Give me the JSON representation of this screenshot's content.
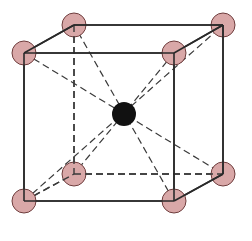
{
  "diagram": {
    "type": "body-centered-cubic-unit-cell",
    "width": 252,
    "height": 241,
    "colors": {
      "background": "#ffffff",
      "edge": "#2a2a2a",
      "dashed": "#3a3a3a",
      "corner_fill": "#d9a8a8",
      "corner_stroke": "#6e3d3d",
      "center_fill": "#111111"
    },
    "atom_radius": 12,
    "center_radius": 12,
    "vertices": {
      "FTL": [
        24,
        53
      ],
      "FTR": [
        174,
        53
      ],
      "FBL": [
        24,
        201
      ],
      "FBR": [
        174,
        201
      ],
      "BTL": [
        74,
        25
      ],
      "BTR": [
        223,
        25
      ],
      "BBL": [
        74,
        174
      ],
      "BBR": [
        223,
        174
      ]
    },
    "center": [
      124,
      114
    ],
    "solid_edges": [
      [
        "FTL",
        "FTR"
      ],
      [
        "FTR",
        "FBR"
      ],
      [
        "FBR",
        "FBL"
      ],
      [
        "FBL",
        "FTL"
      ],
      [
        "BTL",
        "BTR"
      ],
      [
        "BTR",
        "BBR"
      ],
      [
        "FTL",
        "BTL"
      ],
      [
        "FTR",
        "BTR"
      ],
      [
        "FBR",
        "BBR"
      ]
    ],
    "dashed_edges": [
      [
        "BTL",
        "BBL"
      ],
      [
        "BBL",
        "BBR"
      ],
      [
        "FBL",
        "BBL"
      ]
    ],
    "body_diagonals": [
      [
        "FTL",
        "BBR"
      ],
      [
        "FTR",
        "BBL"
      ],
      [
        "FBL",
        "BTR"
      ],
      [
        "FBR",
        "BTL"
      ]
    ],
    "corner_atoms": [
      "BTL",
      "BTR",
      "BBL",
      "BBR",
      "FTL",
      "FTR",
      "FBL",
      "FBR"
    ]
  }
}
